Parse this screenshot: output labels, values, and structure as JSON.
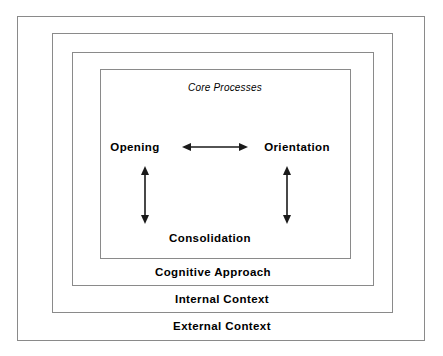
{
  "diagram": {
    "title_label": "Core Processes",
    "rings": [
      {
        "id": "external",
        "label": "External Context"
      },
      {
        "id": "internal",
        "label": "Internal Context"
      },
      {
        "id": "cognitive",
        "label": "Cognitive Approach"
      },
      {
        "id": "core",
        "label": "Core Processes"
      }
    ],
    "nodes": [
      {
        "id": "opening",
        "label": "Opening"
      },
      {
        "id": "orientation",
        "label": "Orientation"
      },
      {
        "id": "consolidation",
        "label": "Consolidation"
      }
    ],
    "connectors": [
      {
        "id": "opening-orientation",
        "from": "Opening",
        "to": "Orientation",
        "style": "double-headed",
        "orientation": "horizontal"
      },
      {
        "id": "opening-consolidation",
        "from": "Opening",
        "to": "Consolidation",
        "style": "double-headed",
        "orientation": "vertical"
      },
      {
        "id": "orientation-consolidation",
        "from": "Orientation",
        "to": "Consolidation",
        "style": "double-headed",
        "orientation": "vertical"
      }
    ],
    "colors": {
      "border": "#8a8a8a",
      "text": "#000000",
      "arrow": "#1a1a1a",
      "background": "#ffffff"
    }
  }
}
